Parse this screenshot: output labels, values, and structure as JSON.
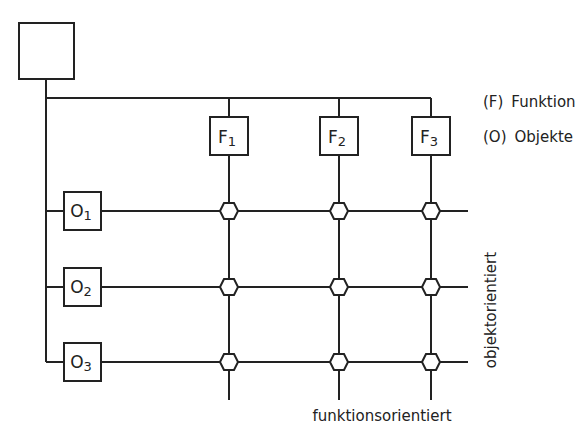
{
  "diagram": {
    "root": {
      "label": ""
    },
    "functions": [
      {
        "letter": "F",
        "index": "1"
      },
      {
        "letter": "F",
        "index": "2"
      },
      {
        "letter": "F",
        "index": "3"
      }
    ],
    "objects": [
      {
        "letter": "O",
        "index": "1"
      },
      {
        "letter": "O",
        "index": "2"
      },
      {
        "letter": "O",
        "index": "3"
      }
    ],
    "legend": [
      {
        "key": "(F)",
        "text": "Funktion"
      },
      {
        "key": "(O)",
        "text": "Objekte"
      }
    ],
    "axis_labels": {
      "horizontal": "funktionsorientiert",
      "vertical": "objektorientiert"
    },
    "colors": {
      "stroke": "#222222",
      "background": "#ffffff"
    }
  }
}
